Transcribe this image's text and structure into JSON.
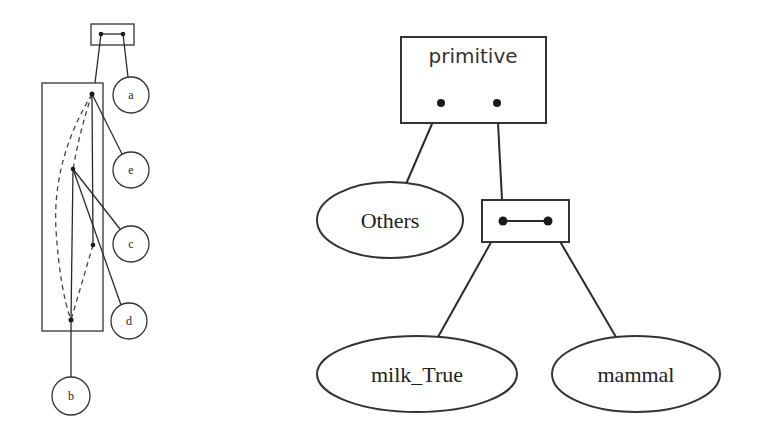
{
  "left_diagram": {
    "nodes": [
      {
        "id": "a",
        "label": "a"
      },
      {
        "id": "e",
        "label": "e"
      },
      {
        "id": "c",
        "label": "c"
      },
      {
        "id": "d",
        "label": "d"
      },
      {
        "id": "b",
        "label": "b"
      }
    ]
  },
  "right_diagram": {
    "root_box": {
      "label": "primitive"
    },
    "nodes": [
      {
        "id": "others",
        "label": "Others"
      },
      {
        "id": "milk_true",
        "label": "milk_True"
      },
      {
        "id": "mammal",
        "label": "mammal"
      }
    ]
  }
}
